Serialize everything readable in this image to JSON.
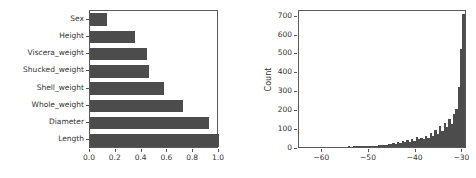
{
  "figure": {
    "background": "#ffffff",
    "bar_color": "#4c4c4c",
    "axis_color": "#5a5a5a",
    "text_color": "#333333"
  },
  "chart_data": [
    {
      "type": "bar",
      "orientation": "horizontal",
      "title": "",
      "xlabel": "",
      "ylabel": "",
      "categories": [
        "Sex",
        "Height",
        "Viscera_weight",
        "Shucked_weight",
        "Shell_weight",
        "Whole_weight",
        "Diameter",
        "Length"
      ],
      "values": [
        0.13,
        0.35,
        0.44,
        0.46,
        0.57,
        0.72,
        0.92,
        1.0
      ],
      "xlim": [
        0.0,
        1.0
      ],
      "xticks": [
        0.0,
        0.2,
        0.4,
        0.6,
        0.8,
        1.0
      ],
      "xticklabels": [
        "0.0",
        "0.2",
        "0.4",
        "0.6",
        "0.8",
        "1.0"
      ],
      "grid": false,
      "legend": "none"
    },
    {
      "type": "histogram",
      "title": "",
      "xlabel": "",
      "ylabel": "Count",
      "xlim": [
        -65.0,
        -29.0
      ],
      "ylim": [
        0,
        730
      ],
      "xticks": [
        -60,
        -50,
        -40,
        -30
      ],
      "xticklabels": [
        "−60",
        "−50",
        "−40",
        "−30"
      ],
      "yticks": [
        0,
        100,
        200,
        300,
        400,
        500,
        600,
        700
      ],
      "yticklabels": [
        "0",
        "100",
        "200",
        "300",
        "400",
        "500",
        "600",
        "700"
      ],
      "grid": false,
      "legend": "none",
      "bin_edges": [
        -65.0,
        -64.5,
        -64.0,
        -63.5,
        -63.0,
        -62.5,
        -62.0,
        -61.5,
        -61.0,
        -60.5,
        -60.0,
        -59.5,
        -59.0,
        -58.5,
        -58.0,
        -57.5,
        -57.0,
        -56.5,
        -56.0,
        -55.5,
        -55.0,
        -54.5,
        -54.0,
        -53.5,
        -53.0,
        -52.5,
        -52.0,
        -51.5,
        -51.0,
        -50.5,
        -50.0,
        -49.5,
        -49.0,
        -48.5,
        -48.0,
        -47.5,
        -47.0,
        -46.5,
        -46.0,
        -45.5,
        -45.0,
        -44.5,
        -44.0,
        -43.5,
        -43.0,
        -42.5,
        -42.0,
        -41.5,
        -41.0,
        -40.5,
        -40.0,
        -39.5,
        -39.0,
        -38.5,
        -38.0,
        -37.5,
        -37.0,
        -36.5,
        -36.0,
        -35.5,
        -35.0,
        -34.5,
        -34.0,
        -33.5,
        -33.0,
        -32.5,
        -32.0,
        -31.5,
        -31.0,
        -30.5,
        -30.0,
        -29.5,
        -29.0
      ],
      "counts": [
        0,
        0,
        0,
        0,
        0,
        0,
        0,
        0,
        0,
        0,
        0,
        0,
        0,
        0,
        0,
        0,
        0,
        0,
        0,
        0,
        0,
        1,
        0,
        2,
        1,
        3,
        2,
        4,
        3,
        5,
        6,
        4,
        8,
        7,
        10,
        9,
        13,
        11,
        16,
        14,
        22,
        18,
        26,
        20,
        30,
        24,
        36,
        28,
        42,
        33,
        52,
        40,
        48,
        44,
        60,
        50,
        72,
        58,
        90,
        68,
        110,
        86,
        128,
        104,
        150,
        120,
        175,
        200,
        320,
        518,
        705,
        0,
        0
      ]
    }
  ]
}
